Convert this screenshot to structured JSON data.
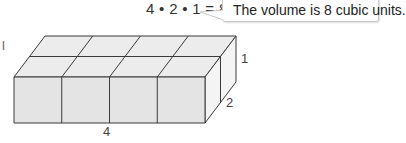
{
  "equation": "4 • 2 • 1 = 8",
  "callout": {
    "text": "The volume is 8 cubic units."
  },
  "dimensions": {
    "length": "4",
    "width": "2",
    "height": "1"
  },
  "cut_label": "l",
  "figure": {
    "type": "rectangular-prism-of-unit-cubes",
    "cubes_length": 4,
    "cubes_width": 2,
    "cubes_height": 1,
    "fill_front": "#e6e6e6",
    "fill_top": "#ececec",
    "fill_side": "#f3f3f3",
    "edge_color": "#3a3a3a"
  }
}
